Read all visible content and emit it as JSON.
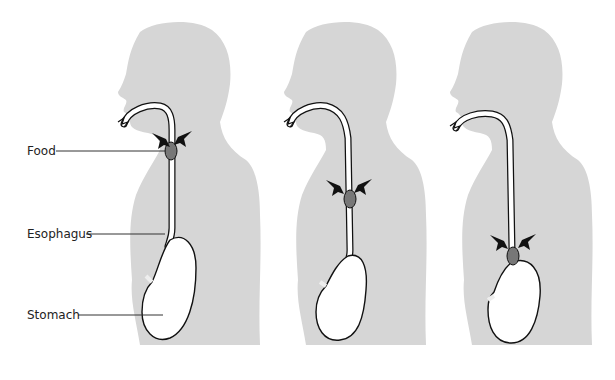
{
  "diagram": {
    "type": "peristalsis-sequence",
    "panel_count": 3,
    "labels": [
      {
        "text": "Food",
        "target": "food-bolus"
      },
      {
        "text": "Esophagus",
        "target": "esophagus"
      },
      {
        "text": "Stomach",
        "target": "stomach"
      }
    ],
    "panels": [
      {
        "stage": 1,
        "bolus_position": "upper"
      },
      {
        "stage": 2,
        "bolus_position": "middle"
      },
      {
        "stage": 3,
        "bolus_position": "lower"
      }
    ]
  },
  "colors": {
    "silhouette": "#d6d6d6",
    "tract_fill": "#ffffff",
    "tract_outline": "#111111",
    "bolus": "#777777",
    "arrows": "#111111",
    "leader_lines": "#333333",
    "label_text": "#222222"
  }
}
